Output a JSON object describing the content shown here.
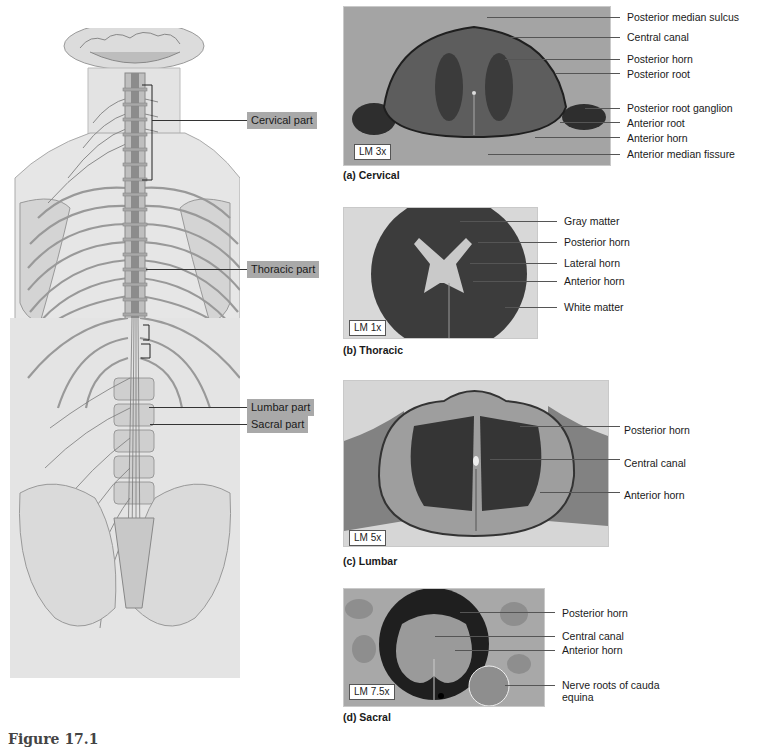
{
  "figure": {
    "caption_visible": "Figure 17.1"
  },
  "illustration": {
    "name": "Posterior view of spinal cord",
    "parts": [
      {
        "label": "Cervical part"
      },
      {
        "label": "Thoracic part"
      },
      {
        "label": "Lumbar part"
      },
      {
        "label": "Sacral part"
      }
    ]
  },
  "panels": [
    {
      "id": "a",
      "caption": "(a) Cervical",
      "magnification": "LM 3x",
      "labels": [
        "Posterior median sulcus",
        "Central canal",
        "Posterior horn",
        "Posterior root",
        "Posterior root ganglion",
        "Anterior root",
        "Anterior horn",
        "Anterior median fissure"
      ]
    },
    {
      "id": "b",
      "caption": "(b) Thoracic",
      "magnification": "LM 1x",
      "labels": [
        "Gray matter",
        "Posterior horn",
        "Lateral horn",
        "Anterior horn",
        "White matter"
      ]
    },
    {
      "id": "c",
      "caption": "(c) Lumbar",
      "magnification": "LM 5x",
      "labels": [
        "Posterior horn",
        "Central canal",
        "Anterior horn"
      ]
    },
    {
      "id": "d",
      "caption": "(d) Sacral",
      "magnification": "LM 7.5x",
      "labels": [
        "Posterior horn",
        "Central canal",
        "Anterior horn",
        "Nerve roots of cauda equina"
      ]
    }
  ],
  "colors": {
    "label_box": "#a9a9a9",
    "micrograph_bg": "#9a9a9a",
    "gray_matter_dark": "#3a3a3a",
    "white_matter": "#6e6e6e"
  }
}
